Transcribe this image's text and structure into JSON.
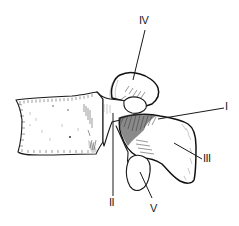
{
  "figure": {
    "labels": {
      "I": "I",
      "II": "II",
      "III": "III",
      "IV": "IV",
      "V": "V"
    }
  }
}
